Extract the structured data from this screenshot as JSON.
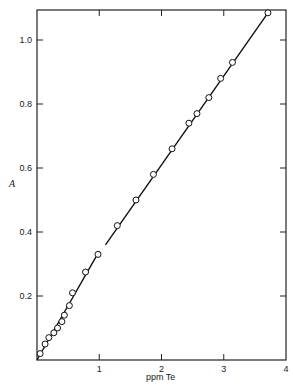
{
  "chart_data": {
    "type": "scatter",
    "title": "",
    "xlabel": "ppm Te",
    "ylabel": "A",
    "xlim": [
      0,
      4
    ],
    "ylim": [
      0,
      1.1
    ],
    "grid": false,
    "legend": null,
    "x_ticks": [
      1,
      2,
      3,
      4
    ],
    "x_tick_labels": [
      "1",
      "2",
      "3",
      "4"
    ],
    "y_ticks": [
      0.2,
      0.4,
      0.6,
      0.8,
      1.0
    ],
    "y_tick_labels": [
      "0.2",
      "0.4",
      "0.6",
      "0.8",
      "1.0"
    ],
    "series": [
      {
        "name": "measured",
        "marker": "open-circle",
        "x": [
          0.05,
          0.13,
          0.19,
          0.27,
          0.33,
          0.4,
          0.44,
          0.52,
          0.57,
          0.78,
          0.98,
          1.29,
          1.59,
          1.87,
          2.17,
          2.44,
          2.57,
          2.76,
          2.95,
          3.14,
          3.71
        ],
        "y": [
          0.02,
          0.05,
          0.07,
          0.085,
          0.1,
          0.12,
          0.14,
          0.17,
          0.21,
          0.275,
          0.33,
          0.42,
          0.5,
          0.58,
          0.66,
          0.74,
          0.77,
          0.82,
          0.88,
          0.93,
          1.085
        ]
      }
    ],
    "fit_lines": [
      {
        "name": "fit-segment-low",
        "x": [
          0.0,
          1.0
        ],
        "y": [
          0.0,
          0.34
        ]
      },
      {
        "name": "fit-segment-high",
        "x": [
          1.1,
          3.73
        ],
        "y": [
          0.36,
          1.09
        ]
      }
    ]
  }
}
